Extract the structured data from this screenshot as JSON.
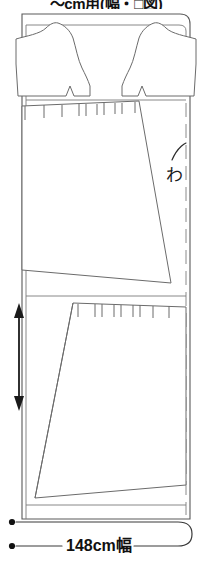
{
  "header": {
    "title": "〜cm用(幅・□図)",
    "title_note": "top of title clipped by image edge"
  },
  "diagram": {
    "kind": "sewing-pattern-cutting-layout",
    "fabric": {
      "width_label": "148cm幅",
      "has_rounded_corner": true,
      "fold_line_style": "dashed"
    },
    "marks": {
      "fold_symbol": "わ",
      "grain_arrow": "double-headed-vertical-arrow"
    },
    "pieces": [
      {
        "name": "bodice-left",
        "label": ""
      },
      {
        "name": "bodice-right",
        "label": ""
      },
      {
        "name": "skirt-upper",
        "label": ""
      },
      {
        "name": "skirt-lower",
        "label": ""
      }
    ]
  },
  "footer": {
    "width_label": "148cm幅"
  },
  "colors": {
    "ink": "#111111",
    "line": "#6b6b6b",
    "fold": "#8a8a8a",
    "paper": "#ffffff"
  }
}
